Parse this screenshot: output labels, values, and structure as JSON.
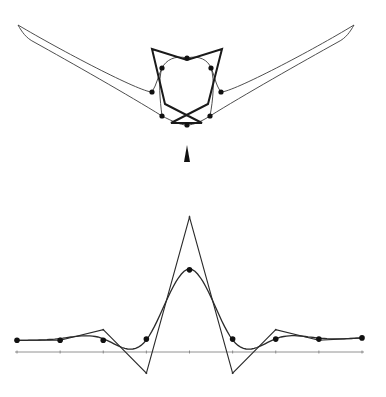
{
  "figure": {
    "colors": {
      "ink": "#1a1a1a",
      "axis": "#777777",
      "background": "#ffffff"
    }
  },
  "top_figure": {
    "control_polygon": [
      [
        -35,
        -76
      ],
      [
        0,
        -65
      ],
      [
        35,
        -76
      ],
      [
        21,
        -21
      ],
      [
        -16,
        -2
      ],
      [
        15,
        -2
      ],
      [
        -22,
        -21
      ]
    ],
    "curve_points": [
      [
        0,
        -67
      ],
      [
        -25,
        -57
      ],
      [
        24,
        -57
      ],
      [
        -35,
        -33
      ],
      [
        34,
        -33
      ],
      [
        -25,
        -9
      ],
      [
        23,
        -9
      ],
      [
        0,
        0
      ]
    ],
    "wing_tips": [
      [
        -169,
        -100
      ],
      [
        167,
        -100
      ]
    ]
  },
  "arrow": {
    "direction": "up",
    "icon": "triangle-pointer"
  },
  "chart_data": {
    "type": "line",
    "title": "",
    "xlabel": "",
    "ylabel": "",
    "x": [
      -4,
      -3,
      -2,
      -1,
      0,
      1,
      2,
      3,
      4
    ],
    "series": [
      {
        "name": "control polygon",
        "values": [
          0.1,
          0.1,
          0.19,
          -0.18,
          1.15,
          -0.18,
          0.19,
          0.1,
          0.12
        ]
      },
      {
        "name": "smoothed points",
        "values": [
          0.1,
          0.1,
          0.1,
          0.11,
          0.7,
          0.11,
          0.11,
          0.11,
          0.12
        ]
      }
    ],
    "xlim": [
      -4,
      4
    ],
    "ylim": [
      -0.3,
      1.2
    ],
    "grid": false,
    "legend": "none"
  }
}
